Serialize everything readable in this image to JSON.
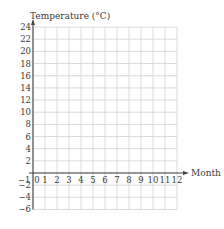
{
  "chart_data": {
    "type": "line",
    "title": "",
    "xlabel": "Month",
    "ylabel": "Temperature (°C)",
    "x_ticks": [
      "−1",
      "0",
      "1",
      "2",
      "3",
      "4",
      "5",
      "6",
      "7",
      "8",
      "9",
      "10",
      "11",
      "12"
    ],
    "y_ticks": [
      "24",
      "22",
      "20",
      "18",
      "16",
      "14",
      "12",
      "10",
      "8",
      "6",
      "4",
      "2",
      "−2",
      "−4",
      "−6"
    ],
    "xlim": [
      0,
      12
    ],
    "ylim": [
      -6,
      24
    ],
    "grid": true,
    "series": [],
    "legend": null,
    "note": "Empty grid — no data points plotted"
  },
  "colors": {
    "grid": "#d0d0d0",
    "axis": "#444444",
    "text": "#3a3a3a"
  }
}
